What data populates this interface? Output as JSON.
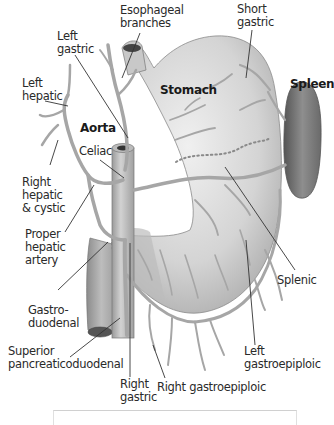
{
  "diagram": {
    "organs": {
      "stomach": "Stomach",
      "spleen": "Spleen",
      "aorta": "Aorta"
    },
    "labels": {
      "esophageal_branches": [
        "Esophageal",
        "branches"
      ],
      "short_gastric": [
        "Short",
        "gastric"
      ],
      "left_gastric": [
        "Left",
        "gastric"
      ],
      "left_hepatic": [
        "Left",
        "hepatic"
      ],
      "celiac": [
        "Celiac"
      ],
      "right_hepatic_cystic": [
        "Right",
        "hepatic",
        "& cystic"
      ],
      "proper_hepatic_artery": [
        "Proper",
        "hepatic",
        "artery"
      ],
      "gastroduodenal": [
        "Gastro-",
        "duodenal"
      ],
      "superior_pancreaticoduodenal": [
        "Superior",
        "pancreaticoduodenal"
      ],
      "right_gastric": [
        "Right",
        "gastric"
      ],
      "right_gastroepiploic": [
        "Right gastroepiploic"
      ],
      "splenic": [
        "Splenic"
      ],
      "left_gastroepiploic": [
        "Left",
        "gastroepiploic"
      ]
    },
    "colors": {
      "stomach_fill": "#d8d8d8",
      "stomach_shade": "#b8b8b8",
      "spleen_fill": "#8a8a8a",
      "vessel": "#a6a6a6",
      "leader_line": "#333333",
      "text": "#2a2a2a"
    }
  }
}
